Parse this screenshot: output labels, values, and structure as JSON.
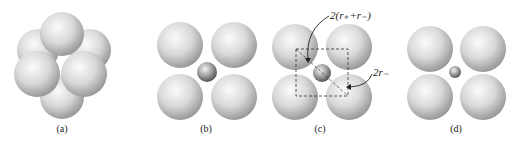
{
  "figure": {
    "panels": [
      {
        "label": "(a)",
        "description": "close-packed octahedral cluster of six large spheres"
      },
      {
        "label": "(b)",
        "description": "four large spheres around a small central sphere"
      },
      {
        "label": "(c)",
        "description": "four large spheres with small sphere; dashed square and diagonal annotated"
      },
      {
        "label": "(d)",
        "description": "four large spheres with a smaller central sphere (rattling)"
      }
    ],
    "annotations": {
      "diagonal": "2(r₊+r₋)",
      "edge": "2r₋"
    }
  }
}
